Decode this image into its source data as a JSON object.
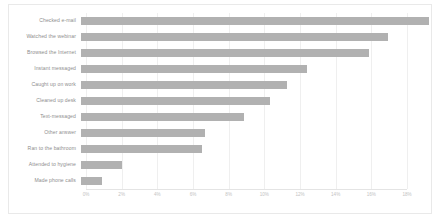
{
  "chart_data": {
    "type": "bar",
    "orientation": "horizontal",
    "title": "",
    "subtitle": "",
    "xlabel": "",
    "ylabel": "",
    "xlim": [
      0,
      18
    ],
    "xtick_labels": [
      "0%",
      "2%",
      "4%",
      "6%",
      "8%",
      "10%",
      "12%",
      "14%",
      "16%",
      "18%"
    ],
    "xtick_values": [
      0,
      2,
      4,
      6,
      8,
      10,
      12,
      14,
      16,
      18
    ],
    "grid": true,
    "legend": "none",
    "units": "%",
    "bar_color": "#b1b1b1",
    "grid_color": "#efefef",
    "label_color": "#8d8d8d",
    "tick_color": "#c3c3c3",
    "categories": [
      "Checked e-mail",
      "Watched the webinar",
      "Browsed the Internet",
      "Instant messaged",
      "Caught up on work",
      "Cleaned up desk",
      "Text-messaged",
      "Other answer",
      "Ran to the bathroom",
      "Attended to hygiene",
      "Made phone calls"
    ],
    "values": [
      17.9,
      15.8,
      14.8,
      11.6,
      10.6,
      9.7,
      8.4,
      6.4,
      6.2,
      2.1,
      1.1
    ],
    "bars": [
      {
        "label": "Checked e-mail",
        "value": 17.9
      },
      {
        "label": "Watched the webinar",
        "value": 15.8
      },
      {
        "label": "Browsed the Internet",
        "value": 14.8
      },
      {
        "label": "Instant messaged",
        "value": 11.6
      },
      {
        "label": "Caught up on work",
        "value": 10.6
      },
      {
        "label": "Cleaned up desk",
        "value": 9.7
      },
      {
        "label": "Text-messaged",
        "value": 8.4
      },
      {
        "label": "Other answer",
        "value": 6.4
      },
      {
        "label": "Ran to the bathroom",
        "value": 6.2
      },
      {
        "label": "Attended to hygiene",
        "value": 2.1
      },
      {
        "label": "Made phone calls",
        "value": 1.1
      }
    ]
  }
}
